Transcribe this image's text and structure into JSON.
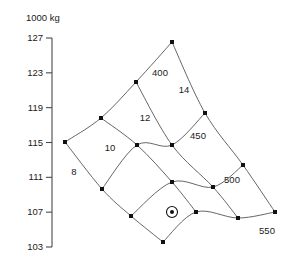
{
  "chart_data": {
    "type": "line",
    "title": "1000 kg",
    "xlabel": "",
    "ylabel": "1000 kg",
    "grid": false,
    "legend_position": "inline-labels",
    "yaxis": {
      "unit_label": "1000 kg",
      "min": 103,
      "max": 127,
      "step": 4,
      "tick_labels": [
        "127",
        "123",
        "119",
        "115",
        "111",
        "107",
        "103"
      ],
      "tick_values": [
        127,
        123,
        119,
        115,
        111,
        107,
        103
      ]
    },
    "series": [
      {
        "name": "8",
        "label": "8",
        "family": "draft",
        "label_x": 74,
        "label_y": 172,
        "points": [
          {
            "x": 65,
            "y": 142
          },
          {
            "x": 102,
            "y": 189
          },
          {
            "x": 131,
            "y": 216
          },
          {
            "x": 163,
            "y": 242
          }
        ]
      },
      {
        "name": "10",
        "label": "10",
        "family": "draft",
        "label_x": 110,
        "label_y": 148,
        "points": [
          {
            "x": 101,
            "y": 118
          },
          {
            "x": 137,
            "y": 145
          },
          {
            "x": 172,
            "y": 182
          },
          {
            "x": 196,
            "y": 212
          }
        ]
      },
      {
        "name": "12",
        "label": "12",
        "family": "draft",
        "label_x": 145,
        "label_y": 118,
        "points": [
          {
            "x": 136,
            "y": 82
          },
          {
            "x": 172,
            "y": 145
          },
          {
            "x": 213,
            "y": 187
          },
          {
            "x": 238,
            "y": 218
          }
        ]
      },
      {
        "name": "14",
        "label": "14",
        "family": "draft",
        "label_x": 184,
        "label_y": 90,
        "points": [
          {
            "x": 172,
            "y": 42
          },
          {
            "x": 205,
            "y": 113
          },
          {
            "x": 243,
            "y": 165
          },
          {
            "x": 275,
            "y": 212
          }
        ]
      },
      {
        "name": "400",
        "label": "400",
        "family": "speed",
        "label_x": 160,
        "label_y": 73,
        "points": [
          {
            "x": 65,
            "y": 142
          },
          {
            "x": 101,
            "y": 118
          },
          {
            "x": 136,
            "y": 82
          },
          {
            "x": 172,
            "y": 42
          }
        ]
      },
      {
        "name": "450",
        "label": "450",
        "family": "speed",
        "label_x": 198,
        "label_y": 136,
        "points": [
          {
            "x": 102,
            "y": 189
          },
          {
            "x": 137,
            "y": 145
          },
          {
            "x": 172,
            "y": 145
          },
          {
            "x": 205,
            "y": 113
          }
        ]
      },
      {
        "name": "500",
        "label": "500",
        "family": "speed",
        "label_x": 232,
        "label_y": 180,
        "points": [
          {
            "x": 131,
            "y": 216
          },
          {
            "x": 172,
            "y": 182
          },
          {
            "x": 213,
            "y": 187
          },
          {
            "x": 243,
            "y": 165
          }
        ]
      },
      {
        "name": "550",
        "label": "550",
        "family": "speed",
        "label_x": 267,
        "label_y": 231
      },
      {
        "name": "550-curve",
        "label": "",
        "family": "speed",
        "points": [
          {
            "x": 163,
            "y": 242
          },
          {
            "x": 196,
            "y": 212
          },
          {
            "x": 238,
            "y": 218
          },
          {
            "x": 275,
            "y": 212
          }
        ]
      }
    ],
    "marker": {
      "name": "operating-point",
      "x": 172,
      "y": 212,
      "style": "filled-dot-with-ring"
    },
    "colors": {
      "mesh": "#555555",
      "node": "#111111",
      "axis": "#4a4a4a",
      "text": "#1a1a1a",
      "background": "#ffffff"
    }
  }
}
